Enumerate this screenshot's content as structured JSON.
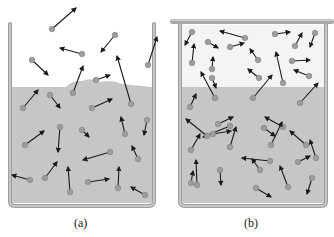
{
  "figure": {
    "colors": {
      "liquid": "#c4c4c4",
      "wall": "#9a9a9a",
      "wall_light": "#cfcfcf",
      "molecule": "#9d9d9d",
      "arrow": "#1a1a1a",
      "vapor_haze": "#ececec"
    },
    "panels": [
      {
        "id": "a",
        "label": "(a)",
        "description": "open container",
        "molecules": [
          [
            52,
            29,
            76,
            8
          ],
          [
            115,
            35,
            101,
            52
          ],
          [
            82,
            54,
            60,
            48
          ],
          [
            32,
            60,
            48,
            75
          ],
          [
            73,
            93,
            83,
            66
          ],
          [
            96,
            80,
            110,
            75
          ],
          [
            131,
            104,
            117,
            56
          ],
          [
            148,
            65,
            157,
            37
          ],
          [
            23,
            108,
            38,
            90
          ],
          [
            50,
            95,
            60,
            108
          ],
          [
            92,
            108,
            112,
            99
          ],
          [
            25,
            145,
            44,
            131
          ],
          [
            30,
            180,
            12,
            175
          ],
          [
            45,
            178,
            57,
            162
          ],
          [
            70,
            192,
            68,
            167
          ],
          [
            60,
            127,
            58,
            152
          ],
          [
            88,
            182,
            109,
            179
          ],
          [
            110,
            152,
            83,
            160
          ],
          [
            125,
            134,
            121,
            117
          ],
          [
            138,
            159,
            132,
            146
          ],
          [
            147,
            120,
            144,
            135
          ],
          [
            118,
            188,
            119,
            167
          ],
          [
            145,
            195,
            131,
            187
          ],
          [
            82,
            130,
            89,
            137
          ]
        ]
      },
      {
        "id": "b",
        "label": "(b)",
        "description": "closed container",
        "molecules": [
          [
            192,
            32,
            185,
            45
          ],
          [
            245,
            38,
            220,
            31
          ],
          [
            208,
            42,
            218,
            48
          ],
          [
            230,
            47,
            244,
            43
          ],
          [
            275,
            34,
            290,
            32
          ],
          [
            295,
            46,
            302,
            33
          ],
          [
            315,
            33,
            310,
            47
          ],
          [
            258,
            60,
            250,
            49
          ],
          [
            192,
            63,
            194,
            44
          ],
          [
            212,
            69,
            213,
            57
          ],
          [
            212,
            78,
            216,
            88
          ],
          [
            259,
            78,
            248,
            69
          ],
          [
            283,
            83,
            276,
            52
          ],
          [
            292,
            61,
            310,
            60
          ],
          [
            309,
            76,
            294,
            70
          ],
          [
            215,
            98,
            201,
            72
          ],
          [
            253,
            98,
            272,
            75
          ],
          [
            300,
            103,
            318,
            83
          ],
          [
            190,
            107,
            196,
            94
          ],
          [
            230,
            126,
            203,
            137
          ],
          [
            207,
            136,
            186,
            119
          ],
          [
            283,
            127,
            265,
            117
          ],
          [
            264,
            128,
            275,
            136
          ],
          [
            218,
            124,
            233,
            117
          ],
          [
            191,
            150,
            200,
            134
          ],
          [
            213,
            134,
            231,
            131
          ],
          [
            230,
            147,
            236,
            127
          ],
          [
            271,
            145,
            282,
            122
          ],
          [
            306,
            145,
            290,
            131
          ],
          [
            197,
            185,
            196,
            160
          ],
          [
            220,
            170,
            221,
            185
          ],
          [
            260,
            170,
            252,
            159
          ],
          [
            270,
            161,
            242,
            158
          ],
          [
            288,
            187,
            280,
            166
          ],
          [
            312,
            178,
            307,
            194
          ],
          [
            316,
            158,
            310,
            140
          ],
          [
            191,
            183,
            193,
            171
          ],
          [
            256,
            188,
            271,
            197
          ],
          [
            298,
            162,
            310,
            156
          ]
        ]
      }
    ]
  }
}
